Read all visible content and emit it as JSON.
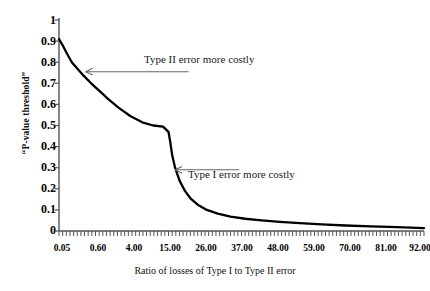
{
  "chart_data": {
    "type": "line",
    "title": "",
    "subtitle": "",
    "xlabel": "Ratio of losses of Type I to Type II error",
    "ylabel": "“P-value threshold”",
    "ylim": [
      0,
      1
    ],
    "ytick_labels": [
      "1",
      "0.9",
      "0.8",
      "0.7",
      "0.6",
      "0.5",
      "0.4",
      "0.3",
      "0.2",
      "0.1",
      "0"
    ],
    "ytick_values": [
      1,
      0.9,
      0.8,
      0.7,
      0.6,
      0.5,
      0.4,
      0.3,
      0.2,
      0.1,
      0
    ],
    "xtick_labels": [
      "0.05",
      "0.60",
      "4.00",
      "15.00",
      "26.00",
      "37.00",
      "48.00",
      "59.00",
      "70.00",
      "81.00",
      "92.00"
    ],
    "xtick_values": [
      0.05,
      0.6,
      4.0,
      15.0,
      26.0,
      37.0,
      48.0,
      59.0,
      70.0,
      81.0,
      92.0
    ],
    "grid": false,
    "legend": "none",
    "series": [
      {
        "name": "P-value threshold vs loss ratio",
        "color": "#000000",
        "x": [
          0.0,
          0.01,
          0.022,
          0.035,
          0.05,
          0.068,
          0.088,
          0.11,
          0.135,
          0.163,
          0.195,
          0.228,
          0.258,
          0.285,
          0.3,
          0.305,
          0.31,
          0.318,
          0.33,
          0.345,
          0.36,
          0.38,
          0.405,
          0.435,
          0.47,
          0.51,
          0.555,
          0.605,
          0.66,
          0.72,
          0.785,
          0.855,
          0.925,
          1.0
        ],
        "y": [
          0.91,
          0.88,
          0.84,
          0.8,
          0.77,
          0.735,
          0.7,
          0.665,
          0.625,
          0.585,
          0.545,
          0.515,
          0.5,
          0.495,
          0.47,
          0.42,
          0.36,
          0.3,
          0.24,
          0.19,
          0.155,
          0.125,
          0.1,
          0.082,
          0.068,
          0.058,
          0.05,
          0.043,
          0.037,
          0.031,
          0.026,
          0.022,
          0.018,
          0.014
        ]
      }
    ],
    "annotations": [
      {
        "id": "annotation-type-ii",
        "text": "Type II error more costly",
        "arrow_tip_x_frac": 0.073,
        "arrow_tip_y_value": 0.755,
        "label_x_frac": 0.355,
        "description": "left-pointing arrow to upper part of curve"
      },
      {
        "id": "annotation-type-i",
        "text": "Type I error more costly",
        "arrow_tip_x_frac": 0.318,
        "arrow_tip_y_value": 0.29,
        "label_x_frac": 0.494,
        "description": "left-pointing arrow to steep drop of curve"
      }
    ],
    "colors": {
      "curve": "#000000",
      "axis": "#555555",
      "annotation_line": "#666666",
      "text": "#000000",
      "background": "#ffffff"
    }
  }
}
